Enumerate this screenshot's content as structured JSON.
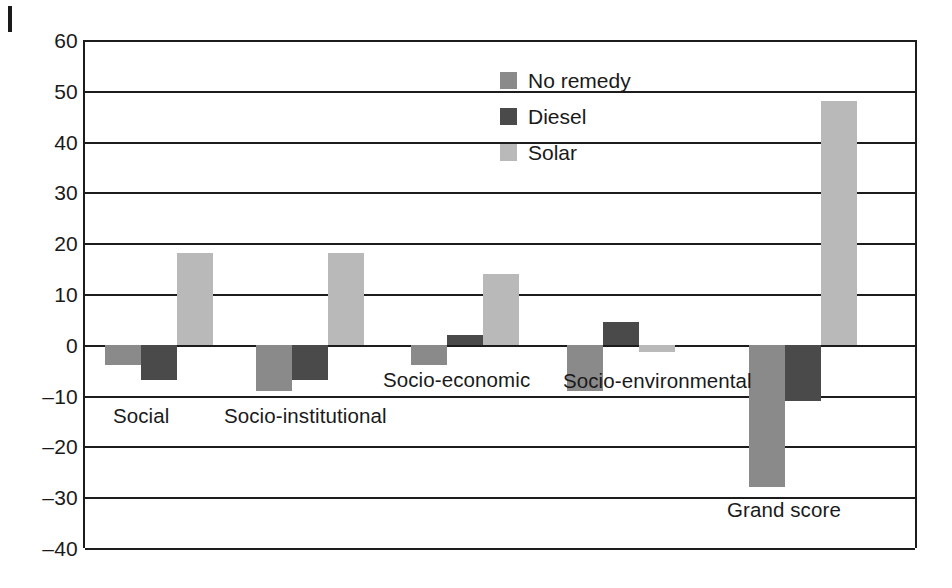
{
  "chart_data": {
    "type": "bar",
    "title": "",
    "subtitle": "",
    "xlabel": "",
    "ylabel": "",
    "ylim": [
      -40,
      60
    ],
    "ytick_step": 10,
    "yticks": [
      60,
      50,
      40,
      30,
      20,
      10,
      0,
      -10,
      -20,
      -30,
      -40
    ],
    "ytick_labels": [
      "60",
      "50",
      "40",
      "30",
      "20",
      "10",
      "0",
      "–10",
      "–20",
      "–30",
      "–40"
    ],
    "grid": true,
    "grid_axis": "y",
    "legend_position": "upper-center",
    "categories": [
      "Social",
      "Socio-institutional",
      "Socio-economic",
      "Socio-environmental",
      "Grand score"
    ],
    "series": [
      {
        "name": "No remedy",
        "color": "#8a8a8a",
        "values": [
          -4,
          -9,
          -4,
          -9,
          -28
        ]
      },
      {
        "name": "Diesel",
        "color": "#4a4a4a",
        "values": [
          -7,
          -7,
          2,
          4.5,
          -11
        ]
      },
      {
        "name": "Solar",
        "color": "#b9b9b9",
        "values": [
          18,
          18,
          14,
          -1.5,
          48
        ]
      }
    ],
    "annotations": []
  },
  "legend": {
    "items": [
      {
        "label": "No remedy",
        "color": "#8a8a8a"
      },
      {
        "label": "Diesel",
        "color": "#4a4a4a"
      },
      {
        "label": "Solar",
        "color": "#b9b9b9"
      }
    ]
  },
  "axis": {
    "y_labels": [
      "60",
      "50",
      "40",
      "30",
      "20",
      "10",
      "0",
      "–10",
      "–20",
      "–30",
      "–40"
    ]
  },
  "category_labels": [
    {
      "text": "Social",
      "x": 113,
      "y": 406
    },
    {
      "text": "Socio-institutional",
      "x": 224,
      "y": 406
    },
    {
      "text": "Socio-economic",
      "x": 383,
      "y": 370
    },
    {
      "text": "Socio-environmental",
      "x": 563,
      "y": 371
    },
    {
      "text": "Grand score",
      "x": 727,
      "y": 500
    }
  ],
  "colors": {
    "background": "#ffffff",
    "axis": "#1c1c1c",
    "text": "#1a1a1a",
    "no_remedy": "#8a8a8a",
    "diesel": "#4a4a4a",
    "solar": "#b9b9b9"
  }
}
